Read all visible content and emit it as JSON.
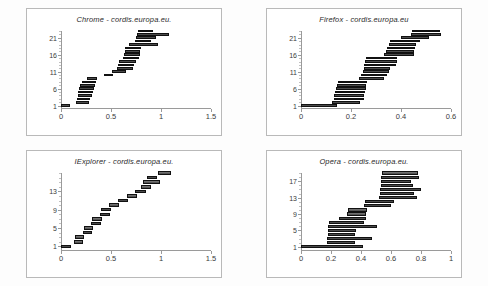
{
  "figure": {
    "background": "#fdfdfd",
    "panel_background": "#ffffff",
    "panel_border_color": "#b9b9b9",
    "bar_color": "#4a4a4a",
    "bar_edge_color": "#111111",
    "axis_color": "#9a9a9a"
  },
  "chart_data": [
    {
      "id": "chrome",
      "type": "bar",
      "orientation": "horizontal",
      "subtype": "gantt-waterfall",
      "title": "Chrome - cordis.europa.eu.",
      "xlabel": "",
      "ylabel": "",
      "xlim": [
        0,
        1.5
      ],
      "ylim": [
        0,
        23
      ],
      "grid": false,
      "legend": null,
      "xticks": [
        0,
        0.5,
        1,
        1.5
      ],
      "xticklabels": [
        "0",
        "0.5",
        "1",
        "1.5"
      ],
      "yticks": [
        1,
        6,
        11,
        16,
        21
      ],
      "yticklabels": [
        "1",
        "6",
        "11",
        "16",
        "21"
      ],
      "bars": [
        {
          "row": 1,
          "start": 0.0,
          "end": 0.09
        },
        {
          "row": 2,
          "start": 0.15,
          "end": 0.28
        },
        {
          "row": 3,
          "start": 0.16,
          "end": 0.29
        },
        {
          "row": 4,
          "start": 0.17,
          "end": 0.31
        },
        {
          "row": 5,
          "start": 0.17,
          "end": 0.32
        },
        {
          "row": 6,
          "start": 0.18,
          "end": 0.33
        },
        {
          "row": 7,
          "start": 0.19,
          "end": 0.34
        },
        {
          "row": 8,
          "start": 0.21,
          "end": 0.35
        },
        {
          "row": 9,
          "start": 0.26,
          "end": 0.36
        },
        {
          "row": 10,
          "start": 0.43,
          "end": 0.52
        },
        {
          "row": 11,
          "start": 0.51,
          "end": 0.65
        },
        {
          "row": 12,
          "start": 0.56,
          "end": 0.72
        },
        {
          "row": 13,
          "start": 0.57,
          "end": 0.73
        },
        {
          "row": 14,
          "start": 0.58,
          "end": 0.75
        },
        {
          "row": 15,
          "start": 0.62,
          "end": 0.78
        },
        {
          "row": 16,
          "start": 0.63,
          "end": 0.79
        },
        {
          "row": 17,
          "start": 0.64,
          "end": 0.79
        },
        {
          "row": 18,
          "start": 0.64,
          "end": 0.8
        },
        {
          "row": 19,
          "start": 0.68,
          "end": 0.97
        },
        {
          "row": 20,
          "start": 0.74,
          "end": 0.9
        },
        {
          "row": 21,
          "start": 0.75,
          "end": 0.95
        },
        {
          "row": 22,
          "start": 0.76,
          "end": 1.08
        },
        {
          "row": 23,
          "start": 0.77,
          "end": 0.92
        }
      ]
    },
    {
      "id": "firefox",
      "type": "bar",
      "orientation": "horizontal",
      "subtype": "gantt-waterfall",
      "title": "Firefox - cordis.europa.eu",
      "xlabel": "",
      "ylabel": "",
      "xlim": [
        0,
        0.6
      ],
      "ylim": [
        0,
        23
      ],
      "grid": false,
      "legend": null,
      "xticks": [
        0,
        0.2,
        0.4,
        0.6
      ],
      "xticklabels": [
        "0",
        "0.2",
        "0.4",
        "0.6"
      ],
      "yticks": [
        1,
        6,
        11,
        16,
        21
      ],
      "yticklabels": [
        "1",
        "6",
        "11",
        "16",
        "21"
      ],
      "bars": [
        {
          "row": 1,
          "start": 0.0,
          "end": 0.145
        },
        {
          "row": 2,
          "start": 0.125,
          "end": 0.235
        },
        {
          "row": 3,
          "start": 0.13,
          "end": 0.25
        },
        {
          "row": 4,
          "start": 0.133,
          "end": 0.253
        },
        {
          "row": 5,
          "start": 0.136,
          "end": 0.256
        },
        {
          "row": 6,
          "start": 0.14,
          "end": 0.258
        },
        {
          "row": 7,
          "start": 0.145,
          "end": 0.26
        },
        {
          "row": 8,
          "start": 0.148,
          "end": 0.262
        },
        {
          "row": 9,
          "start": 0.23,
          "end": 0.33
        },
        {
          "row": 10,
          "start": 0.24,
          "end": 0.345
        },
        {
          "row": 11,
          "start": 0.247,
          "end": 0.352
        },
        {
          "row": 12,
          "start": 0.25,
          "end": 0.355
        },
        {
          "row": 13,
          "start": 0.252,
          "end": 0.38
        },
        {
          "row": 14,
          "start": 0.255,
          "end": 0.382
        },
        {
          "row": 15,
          "start": 0.258,
          "end": 0.385
        },
        {
          "row": 16,
          "start": 0.33,
          "end": 0.45
        },
        {
          "row": 17,
          "start": 0.34,
          "end": 0.452
        },
        {
          "row": 18,
          "start": 0.345,
          "end": 0.455
        },
        {
          "row": 19,
          "start": 0.35,
          "end": 0.458
        },
        {
          "row": 20,
          "start": 0.355,
          "end": 0.475
        },
        {
          "row": 21,
          "start": 0.4,
          "end": 0.512
        },
        {
          "row": 22,
          "start": 0.44,
          "end": 0.56
        },
        {
          "row": 23,
          "start": 0.445,
          "end": 0.555
        }
      ]
    },
    {
      "id": "iexplorer",
      "type": "bar",
      "orientation": "horizontal",
      "subtype": "gantt-waterfall",
      "title": "IExplorer - cordis.europa.eu.",
      "xlabel": "",
      "ylabel": "",
      "xlim": [
        0,
        1.5
      ],
      "ylim": [
        0,
        17
      ],
      "grid": false,
      "legend": null,
      "xticks": [
        0,
        0.5,
        1,
        1.5
      ],
      "xticklabels": [
        "0",
        "0.5",
        "1",
        "1.5"
      ],
      "yticks": [
        1,
        5,
        9,
        13
      ],
      "yticklabels": [
        "1",
        "5",
        "9",
        "13"
      ],
      "bars": [
        {
          "row": 1,
          "start": 0.0,
          "end": 0.1
        },
        {
          "row": 2,
          "start": 0.13,
          "end": 0.22
        },
        {
          "row": 3,
          "start": 0.14,
          "end": 0.23
        },
        {
          "row": 4,
          "start": 0.22,
          "end": 0.31
        },
        {
          "row": 5,
          "start": 0.23,
          "end": 0.32
        },
        {
          "row": 6,
          "start": 0.3,
          "end": 0.4
        },
        {
          "row": 7,
          "start": 0.31,
          "end": 0.41
        },
        {
          "row": 8,
          "start": 0.39,
          "end": 0.49
        },
        {
          "row": 9,
          "start": 0.4,
          "end": 0.5
        },
        {
          "row": 10,
          "start": 0.48,
          "end": 0.58
        },
        {
          "row": 11,
          "start": 0.57,
          "end": 0.67
        },
        {
          "row": 12,
          "start": 0.66,
          "end": 0.76
        },
        {
          "row": 13,
          "start": 0.74,
          "end": 0.85
        },
        {
          "row": 14,
          "start": 0.8,
          "end": 0.9
        },
        {
          "row": 15,
          "start": 0.82,
          "end": 0.99
        },
        {
          "row": 16,
          "start": 0.86,
          "end": 0.96
        },
        {
          "row": 17,
          "start": 0.97,
          "end": 1.1
        }
      ]
    },
    {
      "id": "opera",
      "type": "bar",
      "orientation": "horizontal",
      "subtype": "gantt-waterfall",
      "title": "Opera - cordis.europa.eu.",
      "xlabel": "",
      "ylabel": "",
      "xlim": [
        0,
        1.0
      ],
      "ylim": [
        0,
        19
      ],
      "grid": false,
      "legend": null,
      "xticks": [
        0,
        0.2,
        0.4,
        0.6,
        0.8,
        1
      ],
      "xticklabels": [
        "0",
        "0.2",
        "0.4",
        "0.6",
        "0.8",
        "1"
      ],
      "yticks": [
        1,
        5,
        9,
        13,
        17
      ],
      "yticklabels": [
        "1",
        "5",
        "9",
        "13",
        "17"
      ],
      "bars": [
        {
          "row": 1,
          "start": 0.0,
          "end": 0.415
        },
        {
          "row": 2,
          "start": 0.17,
          "end": 0.36
        },
        {
          "row": 3,
          "start": 0.175,
          "end": 0.47
        },
        {
          "row": 4,
          "start": 0.178,
          "end": 0.36
        },
        {
          "row": 5,
          "start": 0.18,
          "end": 0.365
        },
        {
          "row": 6,
          "start": 0.182,
          "end": 0.51
        },
        {
          "row": 7,
          "start": 0.185,
          "end": 0.42
        },
        {
          "row": 8,
          "start": 0.255,
          "end": 0.43
        },
        {
          "row": 9,
          "start": 0.305,
          "end": 0.43
        },
        {
          "row": 10,
          "start": 0.31,
          "end": 0.44
        },
        {
          "row": 11,
          "start": 0.42,
          "end": 0.6
        },
        {
          "row": 12,
          "start": 0.425,
          "end": 0.62
        },
        {
          "row": 13,
          "start": 0.52,
          "end": 0.77
        },
        {
          "row": 14,
          "start": 0.525,
          "end": 0.755
        },
        {
          "row": 15,
          "start": 0.528,
          "end": 0.8
        },
        {
          "row": 16,
          "start": 0.53,
          "end": 0.745
        },
        {
          "row": 17,
          "start": 0.532,
          "end": 0.735
        },
        {
          "row": 18,
          "start": 0.535,
          "end": 0.785
        },
        {
          "row": 19,
          "start": 0.538,
          "end": 0.78
        }
      ]
    }
  ]
}
